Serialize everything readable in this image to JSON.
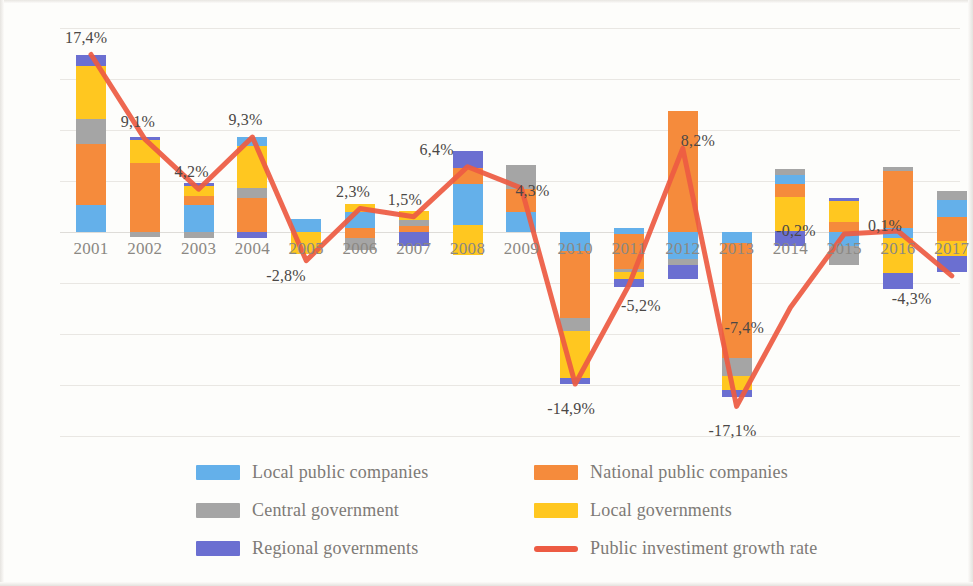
{
  "chart_data": {
    "type": "bar",
    "title": "",
    "subtitle": "",
    "xlabel": "",
    "ylabel": "",
    "ylim": [
      -20,
      20
    ],
    "ytick_values": [
      20,
      15,
      10,
      5,
      0,
      -5,
      -10,
      -15,
      -20
    ],
    "ytick_labels": [
      "20%",
      "15%",
      "10%",
      "5%",
      "0%",
      "-5%",
      "-10%",
      "-15%",
      "-20%"
    ],
    "grid": true,
    "stacked": true,
    "legend_position": "bottom",
    "categories": [
      "2001",
      "2002",
      "2003",
      "2004",
      "2005",
      "2006",
      "2007",
      "2008",
      "2009",
      "2010",
      "2011",
      "2012",
      "2013",
      "2014",
      "2015",
      "2016",
      "2017"
    ],
    "series": [
      {
        "name": "Local public companies",
        "color": "#64B0EA",
        "values": [
          2.6,
          0.0,
          2.6,
          0.0,
          1.3,
          1.6,
          0.0,
          4.0,
          2.0,
          -1.9,
          0.4,
          -2.6,
          -1.1,
          0.9,
          -1.4,
          -0.6,
          1.6
        ]
      },
      {
        "name": "National public companies",
        "color": "#F58B3C",
        "values": [
          6.0,
          6.8,
          0.9,
          3.3,
          0.0,
          -1.2,
          -0.6,
          1.6,
          2.2,
          -6.5,
          -3.4,
          11.9,
          -11.3,
          1.3,
          0.7,
          5.6,
          2.4
        ]
      },
      {
        "name": "Central government",
        "color": "#A5A5A5",
        "values": [
          2.5,
          -0.5,
          -0.6,
          1.0,
          0.0,
          -1.1,
          -0.5,
          0.0,
          2.4,
          -1.3,
          -0.3,
          -0.6,
          -1.7,
          0.6,
          -1.6,
          0.6,
          0.9
        ]
      },
      {
        "name": "Local governments",
        "color": "#FFC720",
        "values": [
          5.2,
          2.2,
          1.3,
          5.0,
          -2.2,
          0.7,
          0.9,
          -2.3,
          0.0,
          -3.6,
          -0.7,
          0.0,
          -0.6,
          3.3,
          0.9,
          -3.3,
          -1.5
        ]
      },
      {
        "name": "Regional governments",
        "color": "#6B6FD1",
        "values": [
          1.1,
          0.3,
          0.0,
          0.9,
          0.0,
          0.0,
          -1.3,
          1.6,
          0.0,
          -0.5,
          -0.9,
          -1.4,
          -0.5,
          -1.4,
          0.1,
          -1.6,
          -1.5
        ]
      }
    ],
    "line_series": {
      "name": "Public investiment growth rate",
      "color": "#ED5B43",
      "values": [
        17.4,
        9.1,
        4.2,
        9.3,
        -2.8,
        2.3,
        1.5,
        6.4,
        4.3,
        -14.9,
        -5.2,
        8.2,
        -17.1,
        -7.4,
        -0.2,
        0.1,
        -4.3
      ],
      "labels": [
        "17,4%",
        "9,1%",
        "4,2%",
        "9,3%",
        "-2,8%",
        "2,3%",
        "1,5%",
        "6,4%",
        "4,3%",
        "-14,9%",
        "-5,2%",
        "8,2%",
        "-17,1%",
        "-7,4%",
        "-0,2%",
        "0,1%",
        "-4,3%"
      ]
    },
    "legend": [
      {
        "label": "Local public companies",
        "color": "#64B0EA",
        "type": "swatch"
      },
      {
        "label": "National public companies",
        "color": "#F58B3C",
        "type": "swatch"
      },
      {
        "label": "Central government",
        "color": "#A5A5A5",
        "type": "swatch"
      },
      {
        "label": "Local governments",
        "color": "#FFC720",
        "type": "swatch"
      },
      {
        "label": "Regional governments",
        "color": "#6B6FD1",
        "type": "swatch"
      },
      {
        "label": "Public investiment growth rate",
        "color": "#ED5B43",
        "type": "line"
      }
    ]
  },
  "bar_stacks": [
    {
      "year": "2001",
      "segments": [
        {
          "s": "Regional governments",
          "c": "#6B6FD1",
          "y0": 16.3,
          "y1": 17.4
        },
        {
          "s": "Local governments",
          "c": "#FFC720",
          "y0": 11.1,
          "y1": 16.3
        },
        {
          "s": "Central government",
          "c": "#A5A5A5",
          "y0": 8.6,
          "y1": 11.1
        },
        {
          "s": "National public companies",
          "c": "#F58B3C",
          "y0": 2.6,
          "y1": 8.6
        },
        {
          "s": "Local public companies",
          "c": "#64B0EA",
          "y0": 0,
          "y1": 2.6
        }
      ]
    },
    {
      "year": "2002",
      "segments": [
        {
          "s": "Regional governments",
          "c": "#6B6FD1",
          "y0": 9.0,
          "y1": 9.3
        },
        {
          "s": "Local governments",
          "c": "#FFC720",
          "y0": 6.8,
          "y1": 9.0
        },
        {
          "s": "National public companies",
          "c": "#F58B3C",
          "y0": 0,
          "y1": 6.8
        },
        {
          "s": "Central government",
          "c": "#A5A5A5",
          "y0": -0.5,
          "y1": 0
        }
      ]
    },
    {
      "year": "2003",
      "segments": [
        {
          "s": "Regional governments",
          "c": "#6B6FD1",
          "y0": 4.5,
          "y1": 4.8
        },
        {
          "s": "Local governments",
          "c": "#FFC720",
          "y0": 3.5,
          "y1": 4.5
        },
        {
          "s": "National public companies",
          "c": "#F58B3C",
          "y0": 2.6,
          "y1": 3.5
        },
        {
          "s": "Local public companies",
          "c": "#64B0EA",
          "y0": 0,
          "y1": 2.6
        },
        {
          "s": "Central government",
          "c": "#A5A5A5",
          "y0": -0.6,
          "y1": 0
        }
      ]
    },
    {
      "year": "2004",
      "segments": [
        {
          "s": "Local public companies",
          "c": "#64B0EA",
          "y0": 8.4,
          "y1": 9.3
        },
        {
          "s": "Local governments",
          "c": "#FFC720",
          "y0": 4.3,
          "y1": 8.4
        },
        {
          "s": "Central government",
          "c": "#A5A5A5",
          "y0": 3.3,
          "y1": 4.3
        },
        {
          "s": "National public companies",
          "c": "#F58B3C",
          "y0": 0,
          "y1": 3.3
        },
        {
          "s": "Regional governments",
          "c": "#6B6FD1",
          "y0": -0.6,
          "y1": 0
        }
      ]
    },
    {
      "year": "2005",
      "segments": [
        {
          "s": "Local public companies",
          "c": "#64B0EA",
          "y0": 0,
          "y1": 1.3
        },
        {
          "s": "Local governments",
          "c": "#FFC720",
          "y0": -2.2,
          "y1": 0
        }
      ]
    },
    {
      "year": "2006",
      "segments": [
        {
          "s": "Local governments",
          "c": "#FFC720",
          "y0": 2.0,
          "y1": 2.7
        },
        {
          "s": "Local public companies",
          "c": "#64B0EA",
          "y0": 0.4,
          "y1": 2.0
        },
        {
          "s": "National public companies",
          "c": "#F58B3C",
          "y0": -0.6,
          "y1": 0.4
        },
        {
          "s": "Central government",
          "c": "#A5A5A5",
          "y0": -1.8,
          "y1": -0.6
        }
      ]
    },
    {
      "year": "2007",
      "segments": [
        {
          "s": "Local governments",
          "c": "#FFC720",
          "y0": 1.2,
          "y1": 2.1
        },
        {
          "s": "Central government",
          "c": "#A5A5A5",
          "y0": 0.6,
          "y1": 1.2
        },
        {
          "s": "National public companies",
          "c": "#F58B3C",
          "y0": 0,
          "y1": 0.6
        },
        {
          "s": "Regional governments",
          "c": "#6B6FD1",
          "y0": -1.4,
          "y1": 0
        }
      ]
    },
    {
      "year": "2008",
      "segments": [
        {
          "s": "Regional governments",
          "c": "#6B6FD1",
          "y0": 6.3,
          "y1": 7.9
        },
        {
          "s": "National public companies",
          "c": "#F58B3C",
          "y0": 4.7,
          "y1": 6.3
        },
        {
          "s": "Local public companies",
          "c": "#64B0EA",
          "y0": 0.7,
          "y1": 4.7
        },
        {
          "s": "Local governments",
          "c": "#FFC720",
          "y0": -2.3,
          "y1": 0.7
        }
      ]
    },
    {
      "year": "2009",
      "segments": [
        {
          "s": "Central government",
          "c": "#A5A5A5",
          "y0": 4.2,
          "y1": 6.6
        },
        {
          "s": "National public companies",
          "c": "#F58B3C",
          "y0": 2.0,
          "y1": 4.2
        },
        {
          "s": "Local public companies",
          "c": "#64B0EA",
          "y0": 0,
          "y1": 2.0
        }
      ]
    },
    {
      "year": "2010",
      "segments": [
        {
          "s": "Local public companies",
          "c": "#64B0EA",
          "y0": -1.9,
          "y1": 0
        },
        {
          "s": "National public companies",
          "c": "#F58B3C",
          "y0": -8.4,
          "y1": -1.9
        },
        {
          "s": "Central government",
          "c": "#A5A5A5",
          "y0": -9.7,
          "y1": -8.4
        },
        {
          "s": "Local governments",
          "c": "#FFC720",
          "y0": -14.3,
          "y1": -9.7
        },
        {
          "s": "Regional governments",
          "c": "#6B6FD1",
          "y0": -14.9,
          "y1": -14.3
        }
      ]
    },
    {
      "year": "2011",
      "segments": [
        {
          "s": "Local public companies",
          "c": "#64B0EA",
          "y0": -0.2,
          "y1": 0.4
        },
        {
          "s": "National public companies",
          "c": "#F58B3C",
          "y0": -3.6,
          "y1": -0.2
        },
        {
          "s": "Central government",
          "c": "#A5A5A5",
          "y0": -3.9,
          "y1": -3.6
        },
        {
          "s": "Local governments",
          "c": "#FFC720",
          "y0": -4.6,
          "y1": -3.9
        },
        {
          "s": "Regional governments",
          "c": "#6B6FD1",
          "y0": -5.4,
          "y1": -4.6
        }
      ]
    },
    {
      "year": "2012",
      "segments": [
        {
          "s": "National public companies",
          "c": "#F58B3C",
          "y0": 0,
          "y1": 11.9
        },
        {
          "s": "Local public companies",
          "c": "#64B0EA",
          "y0": -2.6,
          "y1": 0
        },
        {
          "s": "Central government",
          "c": "#A5A5A5",
          "y0": -3.2,
          "y1": -2.6
        },
        {
          "s": "Regional governments",
          "c": "#6B6FD1",
          "y0": -4.6,
          "y1": -3.2
        }
      ]
    },
    {
      "year": "2013",
      "segments": [
        {
          "s": "Local public companies",
          "c": "#64B0EA",
          "y0": -1.1,
          "y1": 0
        },
        {
          "s": "National public companies",
          "c": "#F58B3C",
          "y0": -12.4,
          "y1": -1.1
        },
        {
          "s": "Central government",
          "c": "#A5A5A5",
          "y0": -14.1,
          "y1": -12.4
        },
        {
          "s": "Local governments",
          "c": "#FFC720",
          "y0": -15.5,
          "y1": -14.1
        },
        {
          "s": "Regional governments",
          "c": "#6B6FD1",
          "y0": -16.2,
          "y1": -15.5
        }
      ]
    },
    {
      "year": "2014",
      "segments": [
        {
          "s": "Central government",
          "c": "#A5A5A5",
          "y0": 5.6,
          "y1": 6.2
        },
        {
          "s": "Local public companies",
          "c": "#64B0EA",
          "y0": 4.7,
          "y1": 5.6
        },
        {
          "s": "National public companies",
          "c": "#F58B3C",
          "y0": 3.4,
          "y1": 4.7
        },
        {
          "s": "Local governments",
          "c": "#FFC720",
          "y0": 0.1,
          "y1": 3.4
        },
        {
          "s": "Regional governments",
          "c": "#6B6FD1",
          "y0": -1.4,
          "y1": 0.1
        }
      ]
    },
    {
      "year": "2015",
      "segments": [
        {
          "s": "Regional governments",
          "c": "#6B6FD1",
          "y0": 3.0,
          "y1": 3.3
        },
        {
          "s": "Local governments",
          "c": "#FFC720",
          "y0": 1.0,
          "y1": 3.0
        },
        {
          "s": "National public companies",
          "c": "#F58B3C",
          "y0": 0,
          "y1": 1.0
        },
        {
          "s": "Local public companies",
          "c": "#64B0EA",
          "y0": -1.4,
          "y1": 0
        },
        {
          "s": "Central government",
          "c": "#A5A5A5",
          "y0": -3.2,
          "y1": -1.4
        }
      ]
    },
    {
      "year": "2016",
      "segments": [
        {
          "s": "Central government",
          "c": "#A5A5A5",
          "y0": 6.0,
          "y1": 6.4
        },
        {
          "s": "National public companies",
          "c": "#F58B3C",
          "y0": 0.4,
          "y1": 6.0
        },
        {
          "s": "Local public companies",
          "c": "#64B0EA",
          "y0": -0.6,
          "y1": 0.4
        },
        {
          "s": "Local governments",
          "c": "#FFC720",
          "y0": -4.0,
          "y1": -0.6
        },
        {
          "s": "Regional governments",
          "c": "#6B6FD1",
          "y0": -5.6,
          "y1": -4.0
        }
      ]
    },
    {
      "year": "2017",
      "segments": [
        {
          "s": "Central government",
          "c": "#A5A5A5",
          "y0": 3.1,
          "y1": 4.0
        },
        {
          "s": "Local public companies",
          "c": "#64B0EA",
          "y0": 1.5,
          "y1": 3.1
        },
        {
          "s": "National public companies",
          "c": "#F58B3C",
          "y0": -0.9,
          "y1": 1.5
        },
        {
          "s": "Local governments",
          "c": "#FFC720",
          "y0": -2.4,
          "y1": -0.9
        },
        {
          "s": "Regional governments",
          "c": "#6B6FD1",
          "y0": -3.9,
          "y1": -2.4
        }
      ]
    }
  ],
  "label_offsets": [
    {
      "year": "2001",
      "dx": -4,
      "dy": -26
    },
    {
      "year": "2002",
      "dx": -2,
      "dy": -26
    },
    {
      "year": "2003",
      "dx": -2,
      "dy": -26
    },
    {
      "year": "2004",
      "dx": -2,
      "dy": -26
    },
    {
      "year": "2005",
      "dx": -18,
      "dy": 6
    },
    {
      "year": "2006",
      "dx": -2,
      "dy": -26
    },
    {
      "year": "2007",
      "dx": -4,
      "dy": -26
    },
    {
      "year": "2008",
      "dx": -26,
      "dy": -26
    },
    {
      "year": "2009",
      "dx": 16,
      "dy": -6
    },
    {
      "year": "2010",
      "dx": -6,
      "dy": 16
    },
    {
      "year": "2011",
      "dx": 14,
      "dy": 12
    },
    {
      "year": "2012",
      "dx": 20,
      "dy": -16
    },
    {
      "year": "2013",
      "dx": -6,
      "dy": 16
    },
    {
      "year": "2014",
      "dx": -44,
      "dy": 12
    },
    {
      "year": "2015",
      "dx": -46,
      "dy": -12
    },
    {
      "year": "2016",
      "dx": -8,
      "dy": -14
    },
    {
      "year": "2017",
      "dx": -38,
      "dy": 14
    }
  ]
}
